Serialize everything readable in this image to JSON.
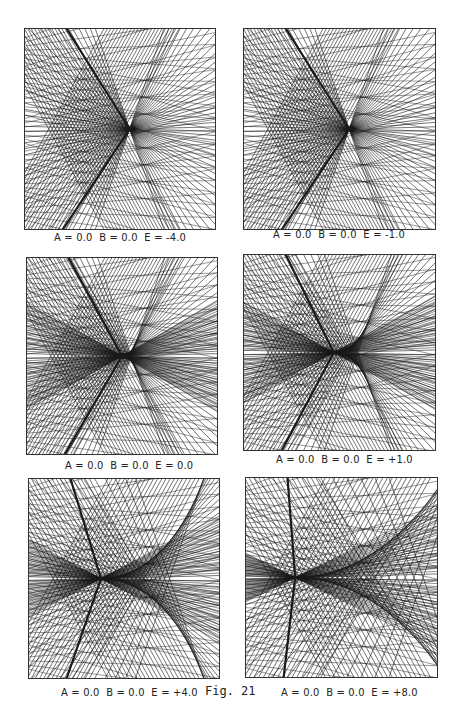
{
  "page": {
    "page_number": "",
    "figure_label": "Fig. 21"
  },
  "panels": [
    {
      "id": "p1",
      "caption": "A = 0.0  B = 0.0  E = -4.0",
      "A": 0.0,
      "B": 0.0,
      "E": -4.0
    },
    {
      "id": "p2",
      "caption": "A = 0.0  B = 0.0  E = -1.0",
      "A": 0.0,
      "B": 0.0,
      "E": -1.0
    },
    {
      "id": "p3",
      "caption": "A = 0.0  B = 0.0  E = 0.0",
      "A": 0.0,
      "B": 0.0,
      "E": 0.0
    },
    {
      "id": "p4",
      "caption": "A = 0.0  B = 0.0  E = +1.0",
      "A": 0.0,
      "B": 0.0,
      "E": 1.0
    },
    {
      "id": "p5",
      "caption": "A = 0.0  B = 0.0  E = +4.0",
      "A": 0.0,
      "B": 0.0,
      "E": 4.0
    },
    {
      "id": "p6",
      "caption": "A = 0.0  B = 0.0  E = +8.0",
      "A": 0.0,
      "B": 0.0,
      "E": 8.0
    }
  ],
  "style": {
    "line_color": "#1a1a1a",
    "frame_color": "#333333",
    "background": "#ffffff"
  }
}
